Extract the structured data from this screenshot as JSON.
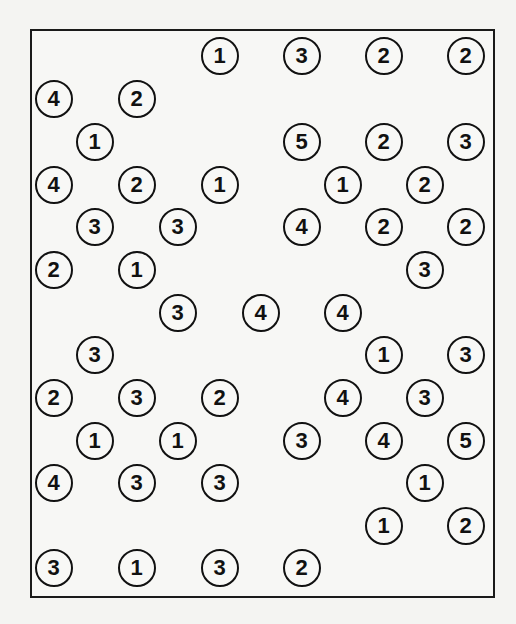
{
  "puzzle": {
    "type": "hashi",
    "grid": {
      "columns": 11,
      "rows": 13,
      "col_x": [
        54,
        95,
        137,
        178,
        220,
        261,
        302,
        343,
        384,
        425,
        466
      ],
      "row_y": [
        56,
        99,
        142,
        185,
        227,
        270,
        313,
        355,
        398,
        441,
        483,
        526,
        568
      ]
    },
    "islands": [
      {
        "row": 0,
        "col": 4,
        "value": "1"
      },
      {
        "row": 0,
        "col": 6,
        "value": "3"
      },
      {
        "row": 0,
        "col": 8,
        "value": "2"
      },
      {
        "row": 0,
        "col": 10,
        "value": "2"
      },
      {
        "row": 1,
        "col": 0,
        "value": "4"
      },
      {
        "row": 1,
        "col": 2,
        "value": "2"
      },
      {
        "row": 2,
        "col": 1,
        "value": "1"
      },
      {
        "row": 2,
        "col": 6,
        "value": "5"
      },
      {
        "row": 2,
        "col": 8,
        "value": "2"
      },
      {
        "row": 2,
        "col": 10,
        "value": "3"
      },
      {
        "row": 3,
        "col": 0,
        "value": "4"
      },
      {
        "row": 3,
        "col": 2,
        "value": "2"
      },
      {
        "row": 3,
        "col": 4,
        "value": "1"
      },
      {
        "row": 3,
        "col": 7,
        "value": "1"
      },
      {
        "row": 3,
        "col": 9,
        "value": "2"
      },
      {
        "row": 4,
        "col": 1,
        "value": "3"
      },
      {
        "row": 4,
        "col": 3,
        "value": "3"
      },
      {
        "row": 4,
        "col": 6,
        "value": "4"
      },
      {
        "row": 4,
        "col": 8,
        "value": "2"
      },
      {
        "row": 4,
        "col": 10,
        "value": "2"
      },
      {
        "row": 5,
        "col": 0,
        "value": "2"
      },
      {
        "row": 5,
        "col": 2,
        "value": "1"
      },
      {
        "row": 5,
        "col": 9,
        "value": "3"
      },
      {
        "row": 6,
        "col": 3,
        "value": "3"
      },
      {
        "row": 6,
        "col": 5,
        "value": "4"
      },
      {
        "row": 6,
        "col": 7,
        "value": "4"
      },
      {
        "row": 7,
        "col": 1,
        "value": "3"
      },
      {
        "row": 7,
        "col": 8,
        "value": "1"
      },
      {
        "row": 7,
        "col": 10,
        "value": "3"
      },
      {
        "row": 8,
        "col": 0,
        "value": "2"
      },
      {
        "row": 8,
        "col": 2,
        "value": "3"
      },
      {
        "row": 8,
        "col": 4,
        "value": "2"
      },
      {
        "row": 8,
        "col": 7,
        "value": "4"
      },
      {
        "row": 8,
        "col": 9,
        "value": "3"
      },
      {
        "row": 9,
        "col": 1,
        "value": "1"
      },
      {
        "row": 9,
        "col": 3,
        "value": "1"
      },
      {
        "row": 9,
        "col": 6,
        "value": "3"
      },
      {
        "row": 9,
        "col": 8,
        "value": "4"
      },
      {
        "row": 9,
        "col": 10,
        "value": "5"
      },
      {
        "row": 10,
        "col": 0,
        "value": "4"
      },
      {
        "row": 10,
        "col": 2,
        "value": "3"
      },
      {
        "row": 10,
        "col": 4,
        "value": "3"
      },
      {
        "row": 10,
        "col": 9,
        "value": "1"
      },
      {
        "row": 11,
        "col": 8,
        "value": "1"
      },
      {
        "row": 11,
        "col": 10,
        "value": "2"
      },
      {
        "row": 12,
        "col": 0,
        "value": "3"
      },
      {
        "row": 12,
        "col": 2,
        "value": "1"
      },
      {
        "row": 12,
        "col": 4,
        "value": "3"
      },
      {
        "row": 12,
        "col": 6,
        "value": "2"
      }
    ]
  }
}
